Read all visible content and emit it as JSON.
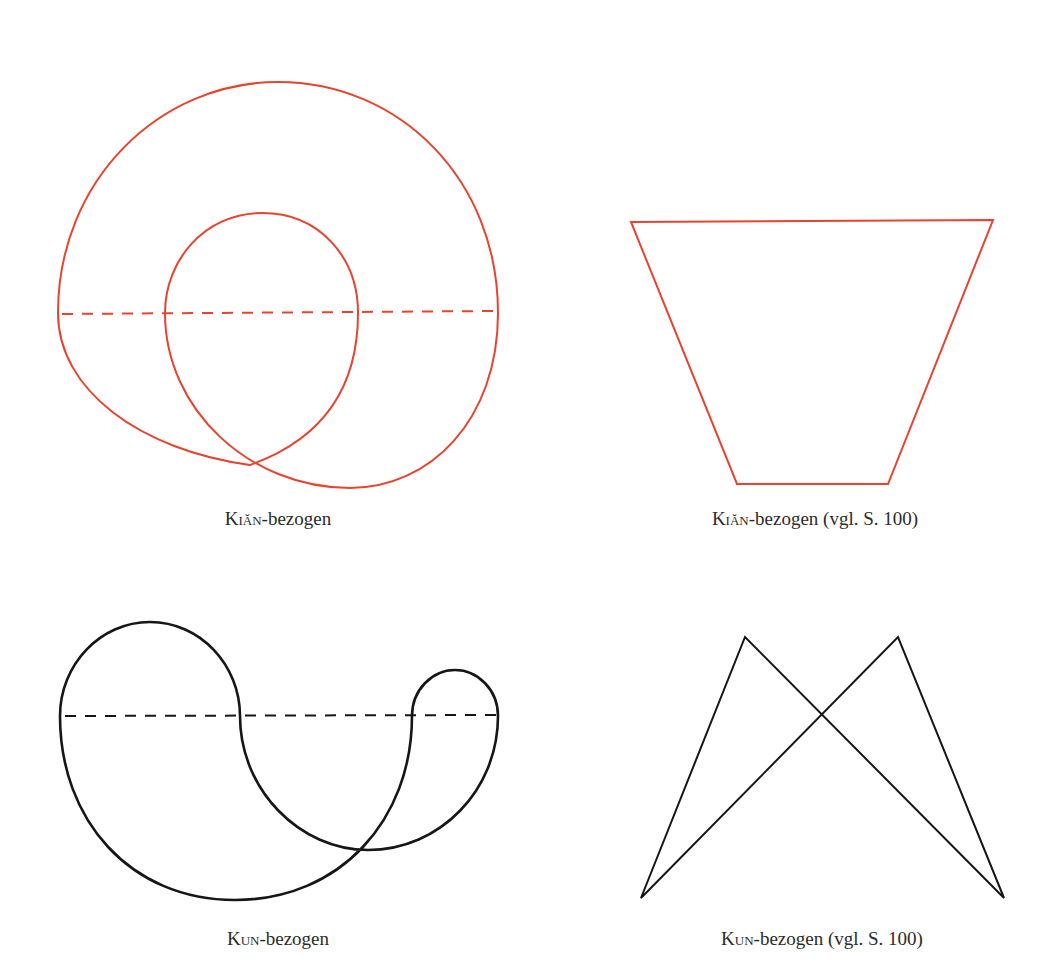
{
  "figures": [
    {
      "id": "kian-curve",
      "caption_prefix": "Kiăn",
      "caption_suffix": "-bezogen",
      "color": "#e8432e",
      "shape": "spiral loop with dashed horizontal axis"
    },
    {
      "id": "kian-trapezoid",
      "caption_prefix": "Kiăn",
      "caption_suffix": "-bezogen (vgl. S. 100)",
      "color": "#e8432e",
      "shape": "inverted trapezoid"
    },
    {
      "id": "kun-curve",
      "caption_prefix": "Kun",
      "caption_suffix": "-bezogen",
      "color": "#161616",
      "shape": "double loop curve with dashed horizontal axis"
    },
    {
      "id": "kun-zigzag",
      "caption_prefix": "Kun",
      "caption_suffix": "-bezogen (vgl. S. 100)",
      "color": "#161616",
      "shape": "crossed M-shaped polyline"
    }
  ]
}
